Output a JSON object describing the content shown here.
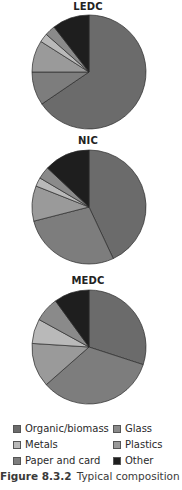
{
  "chart_data": {
    "type": "pie",
    "title": "Typical composition",
    "categories": [
      "Organic/biomass",
      "Paper and card",
      "Plastics",
      "Metals",
      "Glass",
      "Other"
    ],
    "colors": {
      "Organic/biomass": "#6b6b6b",
      "Paper and card": "#7d7d7d",
      "Plastics": "#9a9a9a",
      "Metals": "#b9b9b9",
      "Glass": "#8a8a8a",
      "Other": "#1e1e1e"
    },
    "pies": [
      {
        "title": "LEDC",
        "values": [
          65.5,
          9.5,
          9,
          2.5,
          3,
          10.5
        ]
      },
      {
        "title": "NIC",
        "values": [
          43,
          28,
          10,
          2.5,
          3.5,
          13
        ]
      },
      {
        "title": "MEDC",
        "values": [
          30,
          33.5,
          12.5,
          7,
          7,
          10
        ]
      }
    ],
    "units": "percent (estimated from slice angles)",
    "start_angle": "12 o'clock, clockwise",
    "legend_position": "bottom"
  },
  "legend": {
    "items": [
      {
        "label": "Organic/biomass",
        "color": "#6b6b6b"
      },
      {
        "label": "Glass",
        "color": "#8a8a8a"
      },
      {
        "label": "Metals",
        "color": "#b9b9b9"
      },
      {
        "label": "Plastics",
        "color": "#9a9a9a"
      },
      {
        "label": "Paper and card",
        "color": "#7d7d7d"
      },
      {
        "label": "Other",
        "color": "#1e1e1e"
      }
    ]
  },
  "caption": {
    "figure": "Figure 8.3.2",
    "text": "Typical composition"
  }
}
